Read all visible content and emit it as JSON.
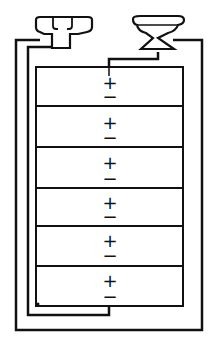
{
  "diagram": {
    "title": "",
    "terminals": [
      {
        "name": "negative-terminal",
        "position": "top-left"
      },
      {
        "name": "positive-terminal",
        "position": "top-right"
      }
    ],
    "cells": [
      {
        "plus": "+",
        "minus": "−"
      },
      {
        "plus": "+",
        "minus": "−"
      },
      {
        "plus": "+",
        "minus": "−"
      },
      {
        "plus": "+",
        "minus": "−"
      },
      {
        "plus": "+",
        "minus": "−"
      },
      {
        "plus": "+",
        "minus": "−"
      }
    ],
    "colors": {
      "line": "#111111",
      "background": "#ffffff"
    }
  }
}
